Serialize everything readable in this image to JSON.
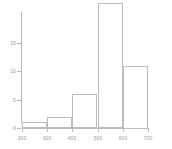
{
  "chart_data": {
    "type": "bar",
    "title": "",
    "subtitle": "",
    "xlabel": "",
    "ylabel": "",
    "categories": [
      "200-300",
      "300-400",
      "400-500",
      "500-600",
      "600-700"
    ],
    "bin_edges": [
      200,
      300,
      400,
      500,
      600,
      700
    ],
    "values": [
      1,
      2,
      6,
      22,
      11
    ],
    "xlim": [
      200,
      700
    ],
    "ylim": [
      0,
      22
    ],
    "xticks": [
      200,
      300,
      400,
      500,
      600,
      700
    ],
    "xtick_labels": [
      "200",
      "300",
      "400",
      "500",
      "600",
      "700"
    ],
    "yticks": [
      0,
      5,
      10,
      15
    ],
    "ytick_labels": [
      "0",
      "5",
      "10",
      "15"
    ],
    "grid": false,
    "legend": false,
    "legend_position": "none",
    "bar_fill": "#ffffff",
    "bar_border": "#bcbcbc",
    "axis_color": "#b9b9b9",
    "text_color": "#9a9a9a",
    "background": "#ffffff",
    "annotations": []
  }
}
